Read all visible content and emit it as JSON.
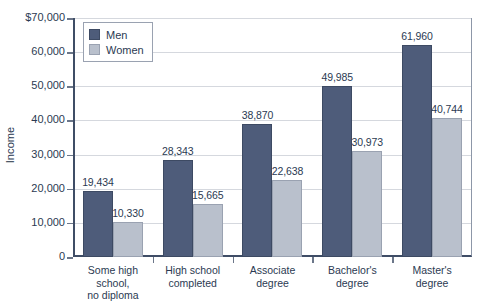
{
  "chart_data": {
    "type": "bar",
    "title": "",
    "xlabel": "",
    "ylabel": "Income",
    "ylim": [
      0,
      70000
    ],
    "ytick_values": [
      0,
      10000,
      20000,
      30000,
      40000,
      50000,
      60000,
      70000
    ],
    "ytick_labels": [
      "0",
      "10,000",
      "20,000",
      "30,000",
      "40,000",
      "50,000",
      "60,000",
      "$70,000"
    ],
    "grid": true,
    "legend_position": "top-left",
    "categories": [
      "Some high school, no diploma",
      "High school completed",
      "Associate degree",
      "Bachelor's degree",
      "Master's degree"
    ],
    "category_label_lines": [
      [
        "Some high",
        "school,",
        "no diploma"
      ],
      [
        "High school",
        "completed"
      ],
      [
        "Associate",
        "degree"
      ],
      [
        "Bachelor's",
        "degree"
      ],
      [
        "Master's",
        "degree"
      ]
    ],
    "series": [
      {
        "name": "Men",
        "color": "#4e5c7a",
        "values": [
          19434,
          28343,
          38870,
          49985,
          61960
        ],
        "value_labels": [
          "19,434",
          "28,343",
          "38,870",
          "49,985",
          "61,960"
        ]
      },
      {
        "name": "Women",
        "color": "#b9c0cc",
        "values": [
          10330,
          15665,
          22638,
          30973,
          40744
        ],
        "value_labels": [
          "10,330",
          "15,665",
          "22,638",
          "30,973",
          "40,744"
        ]
      }
    ]
  },
  "legend": {
    "items": [
      {
        "label": "Men",
        "color": "#4e5c7a"
      },
      {
        "label": "Women",
        "color": "#b9c0cc"
      }
    ]
  },
  "axis": {
    "y_title": "Income"
  },
  "colors": {
    "men": "#4e5c7a",
    "women": "#b9c0cc",
    "text": "#2b3a52",
    "gridline": "#d5d8de",
    "axis": "#3f4d66"
  }
}
